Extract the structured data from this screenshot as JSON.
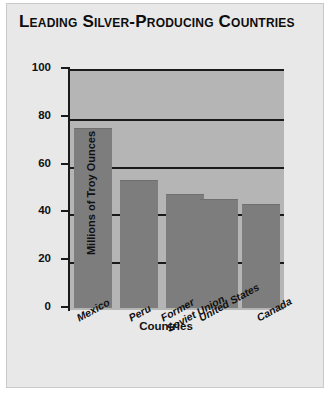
{
  "chart_data": {
    "type": "bar",
    "title": "Leading Silver-Producing Countries",
    "categories": [
      "Mexico",
      "Peru",
      "Former\nSoviet Union",
      "United States",
      "Canada"
    ],
    "values": [
      75.5,
      53.5,
      47.5,
      45.5,
      43.5
    ],
    "xlabel": "Countries",
    "ylabel": "Millions of Troy Ounces",
    "ylim": [
      0,
      100
    ],
    "ytick_labels": [
      "0",
      "20",
      "40",
      "60",
      "80",
      "100"
    ],
    "ytick_values": [
      0,
      20,
      40,
      60,
      80,
      100
    ],
    "grid": true,
    "legend": false,
    "colors": {
      "bar": "#7d7d7d",
      "plot_background": "#b5b5b5",
      "card_background": "#e8e8e8",
      "axis": "#1a1a1a",
      "text": "#111111"
    }
  }
}
